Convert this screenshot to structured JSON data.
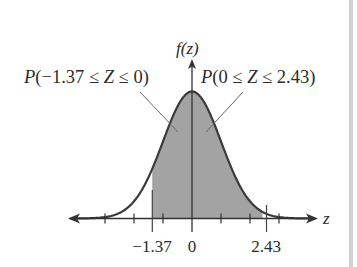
{
  "chart_data": {
    "type": "area",
    "title": "",
    "ylabel": "f(z)",
    "xlabel": "z",
    "xlim": [
      -4,
      4.3
    ],
    "grid": false,
    "ticks": [
      -3,
      -2,
      -1,
      0,
      1,
      2,
      3
    ],
    "labeled_ticks": [
      {
        "value": -1.37,
        "label": "−1.37"
      },
      {
        "value": 0,
        "label": "0"
      },
      {
        "value": 2.43,
        "label": "2.43"
      }
    ],
    "shaded_regions": [
      {
        "from": -1.37,
        "to": 0,
        "label": "P(−1.37 ≤ Z ≤ 0)"
      },
      {
        "from": 0,
        "to": 2.43,
        "label": "P(0 ≤ Z ≤ 2.43)"
      }
    ],
    "curve": "standard normal pdf",
    "colors": {
      "curve": "#3a3a3a",
      "shade": "#a3a3a3",
      "axis": "#333333",
      "leader": "#555555"
    }
  },
  "labels": {
    "y_axis": "f(z)",
    "x_axis": "z",
    "left_region": "P(−1.37 ≤ Z ≤ 0)",
    "right_region": "P(0 ≤ Z ≤ 2.43)",
    "tick_neg": "−1.37",
    "tick_zero": "0",
    "tick_pos": "2.43"
  }
}
